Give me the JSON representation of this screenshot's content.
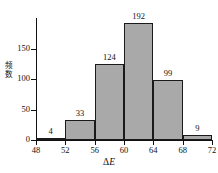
{
  "chart_data": {
    "type": "bar",
    "title": "",
    "subtitle": "",
    "xlabel": "ΔE",
    "ylabel": "频数",
    "categories": [
      "48-52",
      "52-56",
      "56-60",
      "60-64",
      "64-68",
      "68-72"
    ],
    "bin_edges": [
      48,
      52,
      56,
      60,
      64,
      68,
      72
    ],
    "values": [
      4,
      33,
      124,
      192,
      99,
      9
    ],
    "data_labels": [
      "4",
      "33",
      "124",
      "192",
      "99",
      "9"
    ],
    "xticks": [
      "48",
      "52",
      "56",
      "60",
      "64",
      "68",
      "72"
    ],
    "xtick_values": [
      48,
      52,
      56,
      60,
      64,
      68,
      72
    ],
    "yticks": [
      "0",
      "50",
      "100",
      "150"
    ],
    "ytick_values": [
      0,
      50,
      100,
      150
    ],
    "xlim": [
      48,
      72
    ],
    "ylim": [
      0,
      200
    ],
    "grid": false,
    "legend": false,
    "legend_position": "none",
    "bar_fill_color": "#a9a9a9",
    "bar_edge_color": "#1a1a1a",
    "axis_color": "#111111",
    "background_color": "#ffffff"
  }
}
